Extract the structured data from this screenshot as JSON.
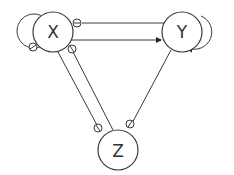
{
  "diagram": {
    "type": "directed-graph",
    "nodes": [
      {
        "id": "X",
        "label": "X"
      },
      {
        "id": "Y",
        "label": "Y"
      },
      {
        "id": "Z",
        "label": "Z"
      }
    ],
    "edges": [
      {
        "from": "X",
        "to": "X",
        "kind": "self-loop",
        "marker": "inhibit-circle"
      },
      {
        "from": "Y",
        "to": "Y",
        "kind": "self-loop",
        "marker": "arrow"
      },
      {
        "from": "Y",
        "to": "X",
        "marker": "inhibit-circle"
      },
      {
        "from": "X",
        "to": "Y",
        "marker": "arrow"
      },
      {
        "from": "Z",
        "to": "X",
        "marker": "inhibit-circle"
      },
      {
        "from": "X",
        "to": "Z",
        "marker": "inhibit-circle"
      },
      {
        "from": "Y",
        "to": "Z",
        "marker": "inhibit-circle"
      }
    ],
    "colors": {
      "stroke": "#3a3a3a",
      "background": "#ffffff"
    }
  }
}
